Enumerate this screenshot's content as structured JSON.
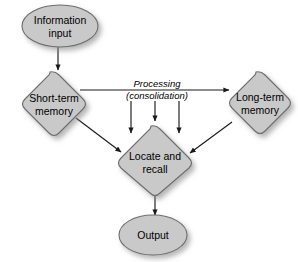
{
  "diagram": {
    "background_color": "#ffffff",
    "shape_fill_color": "#c9c9c9",
    "shape_stroke_color": "#6e6e6e",
    "connector_color": "#1a1a1a",
    "text_color": "#000000",
    "nodes": [
      {
        "id": "information-input",
        "shape": "ellipse",
        "label_line1": "Information",
        "label_line2": "input"
      },
      {
        "id": "short-term-memory",
        "shape": "diamond",
        "label_line1": "Short-term",
        "label_line2": "memory"
      },
      {
        "id": "long-term-memory",
        "shape": "diamond",
        "label_line1": "Long-term",
        "label_line2": "memory"
      },
      {
        "id": "locate-and-recall",
        "shape": "diamond",
        "label_line1": "Locate and",
        "label_line2": "recall"
      },
      {
        "id": "output",
        "shape": "ellipse",
        "label_line1": "Output",
        "label_line2": ""
      }
    ],
    "edge_labels": {
      "processing_line1": "Processing",
      "processing_line2": "(consolidation)"
    }
  }
}
